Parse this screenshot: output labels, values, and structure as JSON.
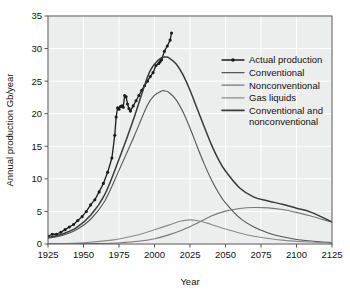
{
  "chart_data": {
    "type": "line",
    "title": "",
    "xlabel": "Year",
    "ylabel": "Annual production Gb/year",
    "xlim": [
      1925,
      2125
    ],
    "ylim": [
      0,
      35
    ],
    "xticks": [
      1925,
      1950,
      1975,
      2000,
      2025,
      2050,
      2075,
      2100,
      2125
    ],
    "yticks": [
      0,
      5,
      10,
      15,
      20,
      25,
      30,
      35
    ],
    "grid": true,
    "legend_position": "upper right",
    "legend": [
      "Actual production",
      "Conventional",
      "Nonconventional",
      "Gas liquids",
      "Conventional and nonconventional"
    ],
    "series": [
      {
        "name": "Actual production",
        "style": "line-markers",
        "color": "#1a1a1a",
        "x": [
          1925,
          1928,
          1931,
          1934,
          1937,
          1940,
          1943,
          1946,
          1949,
          1952,
          1955,
          1958,
          1961,
          1964,
          1967,
          1970,
          1972,
          1973,
          1974,
          1975,
          1976,
          1977,
          1978,
          1979,
          1980,
          1981,
          1982,
          1983,
          1985,
          1987,
          1989,
          1991,
          1993,
          1995,
          1997,
          1999,
          2001,
          2003,
          2004,
          2005,
          2007,
          2009,
          2011,
          2012
        ],
        "y": [
          1.2,
          1.5,
          1.5,
          1.8,
          2.2,
          2.6,
          3.0,
          3.6,
          4.2,
          5.0,
          6.0,
          6.8,
          8.0,
          9.3,
          11.0,
          13.2,
          16.7,
          19.5,
          20.9,
          20.7,
          21.1,
          21.2,
          21.0,
          22.8,
          22.6,
          21.5,
          20.8,
          20.4,
          21.2,
          22.0,
          22.8,
          23.6,
          24.3,
          25.0,
          25.7,
          26.3,
          27.4,
          27.7,
          28.0,
          28.3,
          29.6,
          30.4,
          31.3,
          32.4
        ]
      },
      {
        "name": "Conventional",
        "style": "line",
        "color": "#555555",
        "x": [
          1925,
          1935,
          1945,
          1955,
          1965,
          1975,
          1985,
          1995,
          2000,
          2005,
          2007,
          2010,
          2015,
          2020,
          2025,
          2030,
          2035,
          2040,
          2045,
          2050,
          2060,
          2070,
          2080,
          2090,
          2100,
          2110,
          2125
        ],
        "y": [
          0.9,
          1.3,
          2.2,
          3.8,
          6.6,
          11.3,
          16.2,
          21.3,
          22.8,
          23.5,
          23.5,
          23.3,
          22.2,
          20.3,
          17.8,
          15.0,
          12.3,
          9.9,
          7.9,
          6.3,
          4.0,
          2.6,
          1.7,
          1.1,
          0.7,
          0.45,
          0.2
        ]
      },
      {
        "name": "Nonconventional",
        "style": "line",
        "color": "#777777",
        "x": [
          1925,
          1950,
          1970,
          1980,
          1990,
          2000,
          2010,
          2020,
          2030,
          2040,
          2050,
          2060,
          2070,
          2080,
          2090,
          2100,
          2110,
          2125
        ],
        "y": [
          0.02,
          0.05,
          0.12,
          0.25,
          0.45,
          0.8,
          1.4,
          2.2,
          3.2,
          4.3,
          5.05,
          5.45,
          5.6,
          5.55,
          5.3,
          4.85,
          4.3,
          3.35
        ]
      },
      {
        "name": "Gas liquids",
        "style": "line",
        "color": "#8a8a8a",
        "x": [
          1925,
          1950,
          1970,
          1980,
          1990,
          2000,
          2010,
          2018,
          2025,
          2030,
          2035,
          2040,
          2050,
          2060,
          2070,
          2080,
          2090,
          2100,
          2110,
          2125
        ],
        "y": [
          0.05,
          0.2,
          0.6,
          1.0,
          1.5,
          2.2,
          2.9,
          3.5,
          3.7,
          3.6,
          3.35,
          3.0,
          2.3,
          1.7,
          1.2,
          0.85,
          0.6,
          0.4,
          0.3,
          0.15
        ]
      },
      {
        "name": "Conventional and nonconventional",
        "style": "line",
        "color": "#3a3a3a",
        "x": [
          1925,
          1935,
          1945,
          1955,
          1965,
          1975,
          1985,
          1995,
          2000,
          2005,
          2008,
          2010,
          2015,
          2020,
          2025,
          2030,
          2035,
          2040,
          2045,
          2050,
          2060,
          2070,
          2080,
          2090,
          2100,
          2110,
          2125
        ],
        "y": [
          1.0,
          1.5,
          2.5,
          4.4,
          7.6,
          13.0,
          19.0,
          25.6,
          27.6,
          28.6,
          28.7,
          28.6,
          27.7,
          26.0,
          23.6,
          20.8,
          18.0,
          15.3,
          13.0,
          11.2,
          8.6,
          7.2,
          6.6,
          6.1,
          5.5,
          4.9,
          3.4
        ]
      }
    ]
  },
  "axes": {
    "y_title": "Annual production Gb/year",
    "x_title": "Year",
    "x_tick_labels": [
      "1925",
      "1950",
      "1975",
      "2000",
      "2025",
      "2050",
      "2075",
      "2100",
      "2125"
    ],
    "y_tick_labels": [
      "0",
      "5",
      "10",
      "15",
      "20",
      "25",
      "30",
      "35"
    ]
  },
  "legend": {
    "entries": [
      {
        "label": "Actual production",
        "color": "#1a1a1a",
        "marker": true,
        "width": 1.3
      },
      {
        "label": "Conventional",
        "color": "#555555",
        "marker": false,
        "width": 1.2
      },
      {
        "label": "Nonconventional",
        "color": "#777777",
        "marker": false,
        "width": 1.2
      },
      {
        "label": "Gas liquids",
        "color": "#8a8a8a",
        "marker": false,
        "width": 1.2
      },
      {
        "label": "Conventional and",
        "label2": "nonconventional",
        "color": "#3a3a3a",
        "marker": false,
        "width": 1.6
      }
    ]
  },
  "colors": {
    "plot_background": "#eceded",
    "grid": "#ffffff",
    "axis": "#555555",
    "text": "#111111"
  }
}
